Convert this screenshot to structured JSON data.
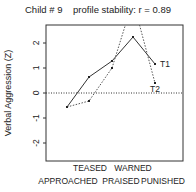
{
  "title": "Child # 9    profile stability: r = 0.89",
  "ylabel": "Verbal Aggression (Z)",
  "yticks": [
    "2",
    "1",
    "0",
    "-1",
    "-2"
  ],
  "xlabels_row1": [
    "TEASED",
    "WARNED"
  ],
  "xlabels_row2": [
    "APPROACHED",
    "PRAISED",
    "PUNISHED"
  ],
  "series_labels": [
    "T1",
    "T2"
  ],
  "chart_data": {
    "type": "line",
    "title": "Child # 9    profile stability: r = 0.89",
    "xlabel": "",
    "ylabel": "Verbal Aggression (Z)",
    "categories": [
      "APPROACHED",
      "TEASED",
      "PRAISED",
      "WARNED",
      "PUNISHED"
    ],
    "series": [
      {
        "name": "T1",
        "style": "solid",
        "values": [
          -0.56,
          0.64,
          1.28,
          2.24,
          1.16
        ]
      },
      {
        "name": "T2",
        "style": "dotted",
        "values": [
          -0.56,
          -0.32,
          1.0,
          3.7,
          0.4
        ]
      }
    ],
    "ylim": [
      -2.7,
      2.7
    ],
    "yticks": [
      -2,
      -1,
      0,
      1,
      2
    ],
    "reference_line": {
      "y": 0,
      "style": "dotted"
    },
    "grid": false,
    "legend": "inline labels at right end of lines"
  }
}
